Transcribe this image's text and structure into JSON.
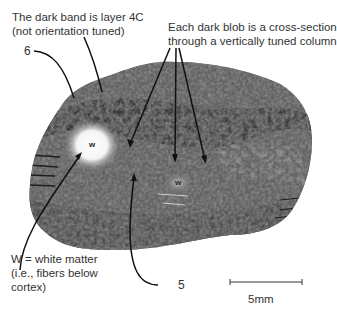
{
  "annotations": {
    "layer4c": {
      "line1": "The dark band is layer 4C",
      "line2": "(not orientation tuned)"
    },
    "blobs": {
      "line1": "Each dark blob is a cross-section",
      "line2": "through a vertically tuned column"
    },
    "white_matter": {
      "line1": "W = white matter",
      "line2": "(i.e., fibers below",
      "line3": "cortex)"
    },
    "layer6": "6",
    "layer5": "5",
    "w_large": "w",
    "w_small": "w"
  },
  "scale_bar": {
    "label": "5mm"
  },
  "colors": {
    "tissue_dark": "#2e2e2e",
    "tissue_mid": "#6b6b6b",
    "tissue_light": "#a8a8a8",
    "white_matter": "#f2f2f2"
  }
}
